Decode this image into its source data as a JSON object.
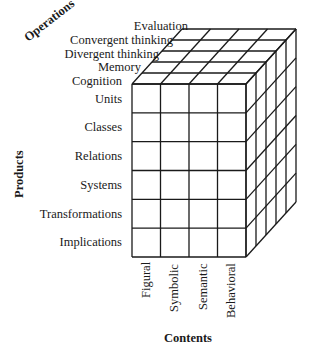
{
  "diagram": {
    "title_cutoff": "",
    "axes": {
      "operations": "Operations",
      "products": "Products",
      "contents": "Contents"
    },
    "operations": [
      "Evaluation",
      "Convergent thinking",
      "Divergent thinking",
      "Memory",
      "Cognition"
    ],
    "products": [
      "Units",
      "Classes",
      "Relations",
      "Systems",
      "Transformations",
      "Implications"
    ],
    "contents": [
      "Figural",
      "Symbolic",
      "Semantic",
      "Behavioral"
    ],
    "line_color": "#1a1a1a"
  }
}
